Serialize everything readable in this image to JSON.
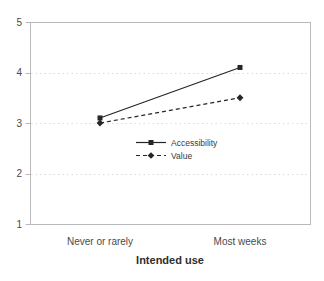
{
  "chart_data": {
    "type": "line",
    "title": "",
    "xlabel": "Intended use",
    "ylabel": "",
    "categories": [
      "Never or rarely",
      "Most weeks"
    ],
    "series": [
      {
        "name": "Accessibility",
        "values": [
          3.1,
          4.1
        ],
        "line": "solid",
        "marker": "square"
      },
      {
        "name": "Value",
        "values": [
          3.0,
          3.5
        ],
        "line": "dashed",
        "marker": "diamond"
      }
    ],
    "ylim": [
      1,
      5
    ],
    "yticks": [
      1,
      2,
      3,
      4,
      5
    ],
    "gridlines": {
      "horizontal_at": [
        2,
        3,
        4
      ],
      "style": "dotted"
    },
    "legend_position": "inside-center",
    "grid": "horizontal-only",
    "colors": {
      "series": "#262626",
      "axis": "#b9b9b9",
      "gridline": "#dcdcdc",
      "text": "#4a4a4a",
      "background": "#ffffff"
    }
  }
}
